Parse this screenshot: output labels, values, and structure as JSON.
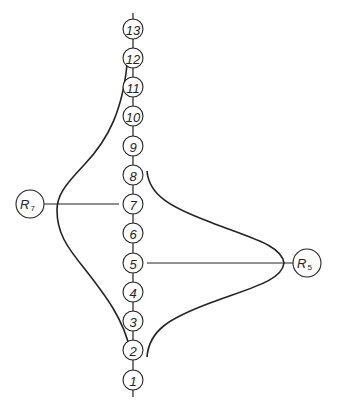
{
  "header": {
    "text": ""
  },
  "chain": {
    "nodes": [
      {
        "label": "13",
        "y": 29
      },
      {
        "label": "12",
        "y": 58
      },
      {
        "label": "11",
        "y": 87
      },
      {
        "label": "10",
        "y": 116
      },
      {
        "label": "9",
        "y": 146
      },
      {
        "label": "8",
        "y": 175
      },
      {
        "label": "7",
        "y": 204
      },
      {
        "label": "6",
        "y": 233
      },
      {
        "label": "5",
        "y": 263
      },
      {
        "label": "4",
        "y": 292
      },
      {
        "label": "3",
        "y": 321
      },
      {
        "label": "2",
        "y": 350
      },
      {
        "label": "1",
        "y": 380
      }
    ]
  },
  "receptors": [
    {
      "id": "R7",
      "main": "R",
      "sub": "7",
      "connects_to": "7",
      "side": "left"
    },
    {
      "id": "R5",
      "main": "R",
      "sub": "5",
      "connects_to": "5",
      "side": "right"
    }
  ],
  "curves": [
    {
      "name": "left-distribution-curve",
      "peak_node": "7",
      "span": [
        "12",
        "2"
      ]
    },
    {
      "name": "right-distribution-curve",
      "peak_node": "5",
      "span": [
        "8",
        "2"
      ]
    }
  ],
  "colors": {
    "stroke": "#222222",
    "background": "#ffffff"
  }
}
